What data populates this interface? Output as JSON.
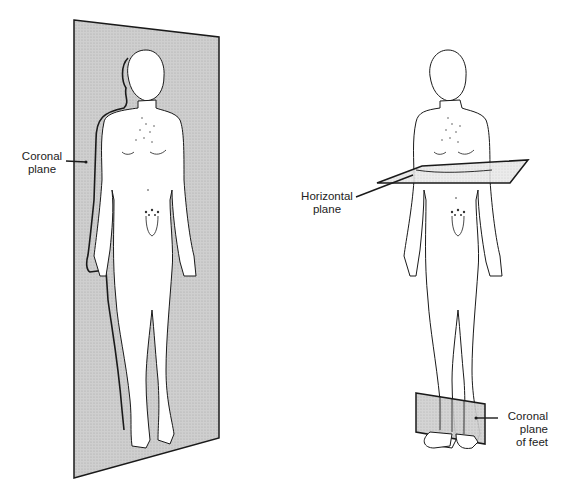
{
  "figure": {
    "left_panel": {
      "description": "Figure standing within coronal plane",
      "label": [
        "Coronal",
        "plane"
      ]
    },
    "right_panel": {
      "description": "Figure transected by horizontal plane, feet in coronal plane",
      "labels": {
        "horizontal": [
          "Horizontal",
          "plane"
        ],
        "coronal_feet": [
          "Coronal",
          "plane",
          "of feet"
        ]
      }
    },
    "colors": {
      "plane_fill": "#c9c9c9",
      "plane_fill_light": "#e6e6e6",
      "line": "#1a1a1a",
      "background": "#ffffff"
    }
  }
}
